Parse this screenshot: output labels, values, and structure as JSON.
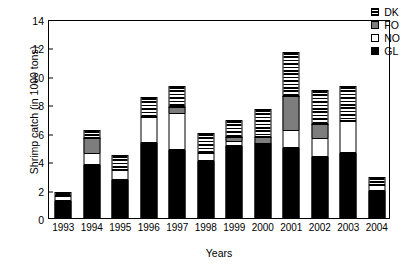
{
  "chart_data": {
    "type": "bar",
    "title": "",
    "stacked": true,
    "xlabel": "Years",
    "ylabel": "Shrimp catch (in 1000 tons)",
    "ylim": [
      0,
      14
    ],
    "ytick_step": 2,
    "yticks": [
      "0",
      "2",
      "4",
      "6",
      "8",
      "10",
      "12",
      "14"
    ],
    "grid": false,
    "legend_position": "top-right",
    "categories": [
      "1993",
      "1994",
      "1995",
      "1996",
      "1997",
      "1998",
      "1999",
      "2000",
      "2001",
      "2002",
      "2003",
      "2004"
    ],
    "series": [
      {
        "name": "GL",
        "fill": "solid-black",
        "color": "#000000",
        "values": [
          1.2,
          3.7,
          2.65,
          5.3,
          4.8,
          4.0,
          5.1,
          5.3,
          4.9,
          4.3,
          4.6,
          1.9
        ]
      },
      {
        "name": "NO",
        "fill": "white-outline",
        "color": "#ffffff",
        "values": [
          0.35,
          0.9,
          0.75,
          1.8,
          2.6,
          0.6,
          0.3,
          0.0,
          1.3,
          1.3,
          2.2,
          0.4
        ]
      },
      {
        "name": "FO",
        "fill": "solid-gray",
        "color": "#7d7d7d",
        "values": [
          0.0,
          1.0,
          0.0,
          0.0,
          0.4,
          0.0,
          0.3,
          0.4,
          2.4,
          1.0,
          0.0,
          0.0
        ]
      },
      {
        "name": "DK",
        "fill": "horizontal-stripes",
        "color": "#000000",
        "values": [
          0.25,
          0.6,
          1.0,
          1.4,
          1.5,
          1.4,
          1.2,
          2.0,
          3.1,
          2.4,
          2.5,
          0.6
        ]
      }
    ],
    "totals": [
      1.8,
      6.2,
      4.4,
      8.5,
      9.3,
      6.0,
      6.9,
      7.7,
      11.7,
      9.0,
      9.3,
      2.9
    ]
  },
  "legend": {
    "entries": [
      {
        "label": "DK"
      },
      {
        "label": "FO"
      },
      {
        "label": "NO"
      },
      {
        "label": "GL"
      }
    ]
  }
}
